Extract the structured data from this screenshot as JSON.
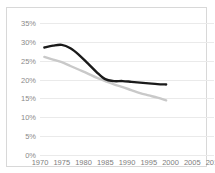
{
  "chart_data": {
    "type": "line",
    "title": "",
    "xlabel": "",
    "ylabel": "",
    "xlim": [
      1970,
      2010
    ],
    "ylim": [
      0,
      35
    ],
    "grid": true,
    "legend_position": "none",
    "x_tick_labels": [
      "1970",
      "1975",
      "1980",
      "1985",
      "1990",
      "1995",
      "2000",
      "2005",
      "2010"
    ],
    "x_ticks": [
      1970,
      1975,
      1980,
      1985,
      1990,
      1995,
      2000,
      2005,
      2010
    ],
    "y_tick_labels": [
      "35%",
      "30%",
      "25%",
      "20%",
      "15%",
      "10%",
      "5%",
      "0%"
    ],
    "y_ticks": [
      35,
      30,
      25,
      20,
      15,
      10,
      5,
      0
    ],
    "series": [
      {
        "name": "dark-line",
        "color": "#1a1a1a",
        "x": [
          1971,
          1973,
          1975,
          1977,
          1979,
          1981,
          1983,
          1985,
          1987,
          1989,
          1991,
          1993,
          1995,
          1997,
          1999
        ],
        "values": [
          28.5,
          29.0,
          29.2,
          28.3,
          26.5,
          24.3,
          22.0,
          20.1,
          19.6,
          19.6,
          19.4,
          19.2,
          19.0,
          18.8,
          18.7
        ]
      },
      {
        "name": "light-line",
        "color": "#c9c9c9",
        "x": [
          1971,
          1973,
          1975,
          1977,
          1979,
          1981,
          1983,
          1985,
          1987,
          1989,
          1991,
          1993,
          1995,
          1997,
          1999
        ],
        "values": [
          26.0,
          25.3,
          24.6,
          23.6,
          22.6,
          21.6,
          20.5,
          19.6,
          18.7,
          18.0,
          17.2,
          16.4,
          15.8,
          15.2,
          14.5
        ]
      }
    ]
  },
  "chart": {
    "title": ""
  }
}
